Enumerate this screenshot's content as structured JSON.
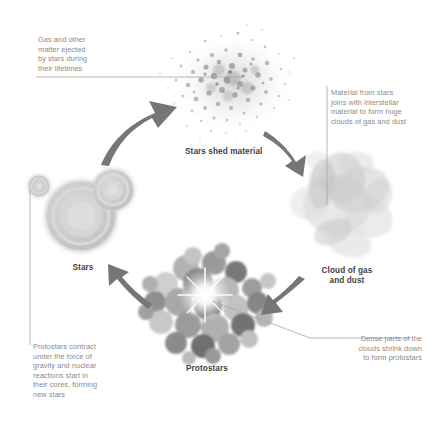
{
  "diagram": {
    "background_color": "#ffffff",
    "text_color": "#8a8a8a",
    "caption_color": "#3f3f3f",
    "arrow_color": "#767676",
    "leader_line_color": "#9e9e9e"
  },
  "annotations": {
    "gas_ejected": "Gas and other\nmatter ejected\nby stars during\ntheir lifetimes",
    "material_from_stars": "Material from stars\njoins with interstellar\nmaterial to form huge\nclouds of gas and dust",
    "protostars_contract": "Protostars contract\nunder the force of\ngravity and nuclear\nreactions start in\ntheir cores, forming\nnew stars",
    "dense_parts": "Dense parts of the\nclouds shrink down\nto form protostars"
  },
  "captions": {
    "stars_shed_material": "Stars shed material",
    "cloud_of_gas_and_dust": "Cloud of gas\nand dust",
    "stars": "Stars",
    "protostars": "Protostars"
  },
  "stages": [
    {
      "id": "stars-shed-material",
      "label": "Stars shed material"
    },
    {
      "id": "cloud-of-gas-and-dust",
      "label": "Cloud of gas and dust"
    },
    {
      "id": "protostars",
      "label": "Protostars"
    },
    {
      "id": "stars",
      "label": "Stars"
    }
  ]
}
